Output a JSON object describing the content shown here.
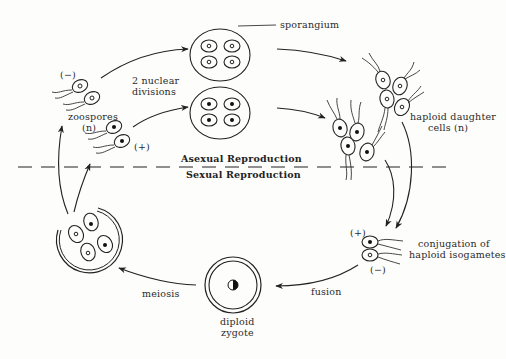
{
  "diagram": {
    "divider": {
      "upper_label": "Asexual Reproduction",
      "lower_label": "Sexual Reproduction"
    },
    "labels": {
      "sporangium": "sporangium",
      "nuclear_divisions_line1": "2 nuclear",
      "nuclear_divisions_line2": "divisions",
      "zoospores_line1": "zoospores",
      "zoospores_line2": "(n)",
      "minus_top": "(−)",
      "plus_zoospore": "(+)",
      "haploid_line1": "haploid daughter",
      "haploid_line2": "cells (n)",
      "conjugation_line1": "conjugation of",
      "conjugation_line2": "haploid isogametes",
      "plus_gamete": "(+)",
      "minus_gamete": "(−)",
      "fusion": "fusion",
      "meiosis": "meiosis",
      "diploid_line1": "diploid",
      "diploid_line2": "zygote"
    },
    "nodes": [
      {
        "id": "zoospores",
        "desc": "four flagellated zoospores, two (−) open nuclei, two (+) filled nuclei"
      },
      {
        "id": "sporangium-minus",
        "desc": "sporangium with 4 cells, open nuclei"
      },
      {
        "id": "sporangium-plus",
        "desc": "sporangium with 4 cells, filled nuclei"
      },
      {
        "id": "haploid-daughter-cells-minus",
        "desc": "cluster of 4 flagellated cells, open nuclei"
      },
      {
        "id": "haploid-daughter-cells-plus",
        "desc": "cluster of 4 flagellated cells, filled nuclei"
      },
      {
        "id": "isogametes",
        "desc": "(+) and (−) gametes conjugating"
      },
      {
        "id": "diploid-zygote",
        "desc": "double-walled zygote with half-filled nucleus"
      },
      {
        "id": "meiotic-cyst",
        "desc": "ruptured wall releasing 4 cells (2 open, 2 filled nuclei)"
      }
    ],
    "edges": [
      {
        "from": "zoospores",
        "to": "sporangium-minus"
      },
      {
        "from": "zoospores",
        "to": "sporangium-plus"
      },
      {
        "from": "sporangium-minus",
        "to": "haploid-daughter-cells-minus"
      },
      {
        "from": "sporangium-plus",
        "to": "haploid-daughter-cells-plus"
      },
      {
        "from": "haploid-daughter-cells-minus",
        "to": "isogametes"
      },
      {
        "from": "haploid-daughter-cells-plus",
        "to": "isogametes"
      },
      {
        "from": "isogametes",
        "to": "diploid-zygote",
        "label": "fusion"
      },
      {
        "from": "diploid-zygote",
        "to": "meiotic-cyst",
        "label": "meiosis"
      },
      {
        "from": "meiotic-cyst",
        "to": "zoospores"
      }
    ]
  }
}
